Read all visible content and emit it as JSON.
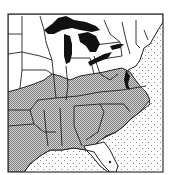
{
  "map": {
    "region": "Eastern United States",
    "style": "monochrome outline",
    "colors": {
      "background": "#ffffff",
      "outline": "#222222",
      "lakes": "#111111",
      "shaded_fill": "#9a9a9a",
      "water_dots": "#8a8a8a"
    },
    "legend": {
      "shaded_states_pattern": "crosshatch",
      "water_pattern": "stipple",
      "lakes_fill": "solid-black"
    },
    "shaded_regions": [
      "southern-missouri",
      "southern-illinois",
      "southern-indiana",
      "southern-ohio",
      "kentucky",
      "tennessee",
      "virginia",
      "north-carolina",
      "south-carolina",
      "georgia",
      "alabama",
      "mississippi",
      "arkansas",
      "louisiana",
      "oklahoma-east",
      "texas-east",
      "maryland-delaware"
    ],
    "unshaded_regions": [
      "minnesota",
      "wisconsin",
      "michigan",
      "iowa",
      "northern-missouri",
      "northern-illinois",
      "northern-indiana",
      "ohio",
      "pennsylvania",
      "new-york",
      "new-england",
      "west-virginia",
      "florida"
    ],
    "water_bodies": [
      "lake-superior",
      "lake-michigan",
      "lake-huron",
      "lake-erie",
      "lake-ontario",
      "atlantic-ocean",
      "gulf-of-mexico"
    ]
  }
}
